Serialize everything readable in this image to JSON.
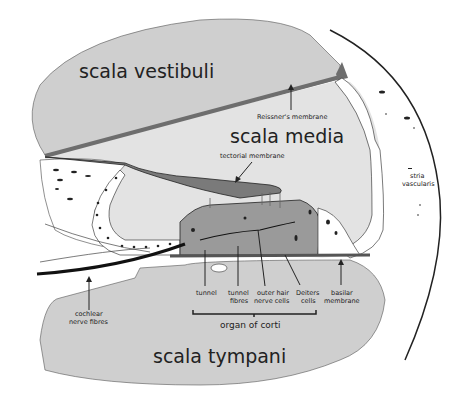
{
  "diagram": {
    "regions": {
      "scala_vestibuli": "scala vestibuli",
      "scala_media": "scala media",
      "scala_tympani": "scala tympani"
    },
    "labels": {
      "reissners_membrane": "Reissner's membrane",
      "tectorial_membrane": "tectorial membrane",
      "stria_line1": "stria",
      "stria_line2": "vascularis",
      "tunnel": "tunnel",
      "tunnel_fibres_line1": "tunnel",
      "tunnel_fibres_line2": "fibres",
      "outer_hair_line1": "outer hair",
      "outer_hair_line2": "nerve cells",
      "deiters_line1": "Deiters",
      "deiters_line2": "cells",
      "basilar_line1": "basilar",
      "basilar_line2": "membrane",
      "cochlear_line1": "cochlear",
      "cochlear_line2": "nerve fibres",
      "organ_of_corti": "organ of corti"
    },
    "colors": {
      "light_fluid": "#e3e3e3",
      "scala_gray": "#cfcfcf",
      "membrane_dark": "#6e6e6e",
      "organ_gray": "#9a9a9a",
      "cell_white": "#ffffff",
      "ink": "#222222"
    }
  }
}
